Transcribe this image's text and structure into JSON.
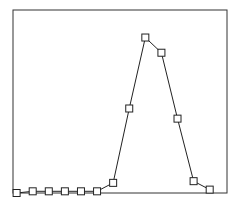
{
  "chart_data": {
    "type": "line",
    "title": "",
    "xlabel": "",
    "ylabel": "",
    "marker": "square",
    "grid": false,
    "legend": null,
    "x": [
      0,
      1,
      2,
      3,
      4,
      5,
      6,
      7,
      8,
      9,
      10,
      11,
      12
    ],
    "series": [
      {
        "name": "series-1",
        "values": [
          0.0,
          0.01,
          0.01,
          0.01,
          0.01,
          0.01,
          0.06,
          0.5,
          0.92,
          0.83,
          0.44,
          0.07,
          0.02
        ]
      }
    ],
    "xlim": [
      -0.1,
      13.2
    ],
    "ylim": [
      0,
      1.0
    ]
  },
  "colors": {
    "line": "#222222",
    "frame": "#333333",
    "background": "#ffffff"
  }
}
